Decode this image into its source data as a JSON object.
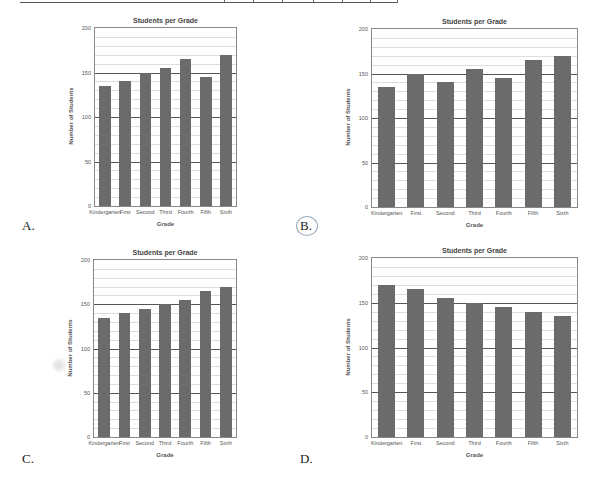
{
  "charts": [
    {
      "option_label": "A.",
      "title": "Students per Grade",
      "xlabel": "Grade",
      "ylabel": "Number of Students",
      "yticks": [
        "0",
        "50",
        "100",
        "150",
        "200"
      ],
      "categories": [
        "Kindergarten",
        "First",
        "Second",
        "Third",
        "Fourth",
        "Fifth",
        "Sixth"
      ],
      "values": [
        135,
        140,
        150,
        155,
        165,
        145,
        170
      ]
    },
    {
      "option_label": "B.",
      "title": "Students per Grade",
      "xlabel": "Grade",
      "ylabel": "Number of Students",
      "yticks": [
        "0",
        "50",
        "100",
        "150",
        "200"
      ],
      "categories": [
        "Kindergarten",
        "First",
        "Second",
        "Third",
        "Fourth",
        "Fifth",
        "Sixth"
      ],
      "values": [
        135,
        150,
        140,
        155,
        145,
        165,
        170
      ]
    },
    {
      "option_label": "C.",
      "title": "Students per Grade",
      "xlabel": "Grade",
      "ylabel": "Number of Students",
      "yticks": [
        "0",
        "50",
        "100",
        "150",
        "200"
      ],
      "categories": [
        "Kindergarten",
        "First",
        "Second",
        "Third",
        "Fourth",
        "Fifth",
        "Sixth"
      ],
      "values": [
        135,
        140,
        145,
        150,
        155,
        165,
        170
      ]
    },
    {
      "option_label": "D.",
      "title": "Students per Grade",
      "xlabel": "Grade",
      "ylabel": "Number of Students",
      "yticks": [
        "0",
        "50",
        "100",
        "150",
        "200"
      ],
      "categories": [
        "Kindergarten",
        "First",
        "Second",
        "Third",
        "Fourth",
        "Fifth",
        "Sixth"
      ],
      "values": [
        170,
        165,
        155,
        150,
        145,
        140,
        135
      ]
    }
  ],
  "chart_data": [
    {
      "type": "bar",
      "title": "Students per Grade",
      "xlabel": "Grade",
      "ylabel": "Number of Students",
      "categories": [
        "Kindergarten",
        "First",
        "Second",
        "Third",
        "Fourth",
        "Fifth",
        "Sixth"
      ],
      "values": [
        135,
        140,
        150,
        155,
        165,
        145,
        170
      ],
      "ylim": [
        0,
        200
      ],
      "yticks": [
        0,
        50,
        100,
        150,
        200
      ],
      "grid": true,
      "legend": null,
      "annotation": "A."
    },
    {
      "type": "bar",
      "title": "Students per Grade",
      "xlabel": "Grade",
      "ylabel": "Number of Students",
      "categories": [
        "Kindergarten",
        "First",
        "Second",
        "Third",
        "Fourth",
        "Fifth",
        "Sixth"
      ],
      "values": [
        135,
        150,
        140,
        155,
        145,
        165,
        170
      ],
      "ylim": [
        0,
        200
      ],
      "yticks": [
        0,
        50,
        100,
        150,
        200
      ],
      "grid": true,
      "legend": null,
      "annotation": "B."
    },
    {
      "type": "bar",
      "title": "Students per Grade",
      "xlabel": "Grade",
      "ylabel": "Number of Students",
      "categories": [
        "Kindergarten",
        "First",
        "Second",
        "Third",
        "Fourth",
        "Fifth",
        "Sixth"
      ],
      "values": [
        135,
        140,
        145,
        150,
        155,
        165,
        170
      ],
      "ylim": [
        0,
        200
      ],
      "yticks": [
        0,
        50,
        100,
        150,
        200
      ],
      "grid": true,
      "legend": null,
      "annotation": "C."
    },
    {
      "type": "bar",
      "title": "Students per Grade",
      "xlabel": "Grade",
      "ylabel": "Number of Students",
      "categories": [
        "Kindergarten",
        "First",
        "Second",
        "Third",
        "Fourth",
        "Fifth",
        "Sixth"
      ],
      "values": [
        170,
        165,
        155,
        150,
        145,
        140,
        135
      ],
      "ylim": [
        0,
        200
      ],
      "yticks": [
        0,
        50,
        100,
        150,
        200
      ],
      "grid": true,
      "legend": null,
      "annotation": "D."
    }
  ],
  "style": {
    "bar_color": "#6b6b6b",
    "major_grid_color": "#555555",
    "minor_grid_color": "#dddddd"
  }
}
